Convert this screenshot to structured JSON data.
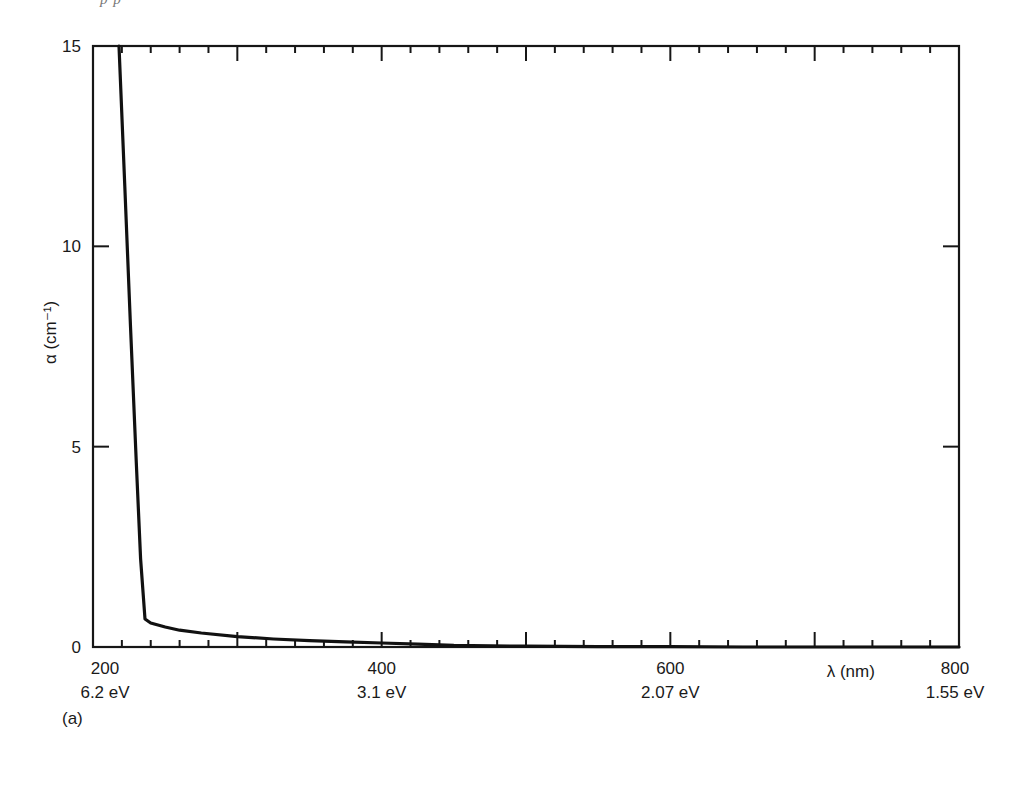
{
  "clipped_caption": "p        p",
  "panel_label": "(a)",
  "chart_data": {
    "type": "line",
    "title": "",
    "xlabel": "λ (nm)",
    "ylabel": "α (cm⁻¹)",
    "xlim": [
      200,
      800
    ],
    "ylim": [
      0,
      15
    ],
    "grid": false,
    "legend": null,
    "x_ticks": [
      200,
      400,
      600,
      800
    ],
    "x_tick_labels": [
      "200",
      "400",
      "600",
      "800"
    ],
    "x_secondary_labels": [
      "6.2 eV",
      "3.1 eV",
      "2.07 eV",
      "1.55 eV"
    ],
    "x_minor_step": 20,
    "x_major_step": 100,
    "y_ticks": [
      0,
      5,
      10,
      15
    ],
    "y_tick_labels": [
      "0",
      "5",
      "10",
      "15"
    ],
    "series": [
      {
        "name": "absorption coefficient",
        "color": "#111111",
        "x": [
          218,
          222,
          226,
          230,
          233,
          236,
          240,
          250,
          260,
          275,
          300,
          325,
          350,
          375,
          400,
          425,
          450,
          500,
          550,
          600,
          650,
          700,
          750,
          800
        ],
        "y": [
          15.0,
          11.5,
          8.0,
          4.6,
          2.2,
          0.7,
          0.6,
          0.5,
          0.42,
          0.35,
          0.26,
          0.2,
          0.16,
          0.13,
          0.1,
          0.07,
          0.04,
          0.02,
          0.01,
          0.01,
          0.0,
          0.0,
          0.0,
          0.0
        ]
      }
    ]
  }
}
